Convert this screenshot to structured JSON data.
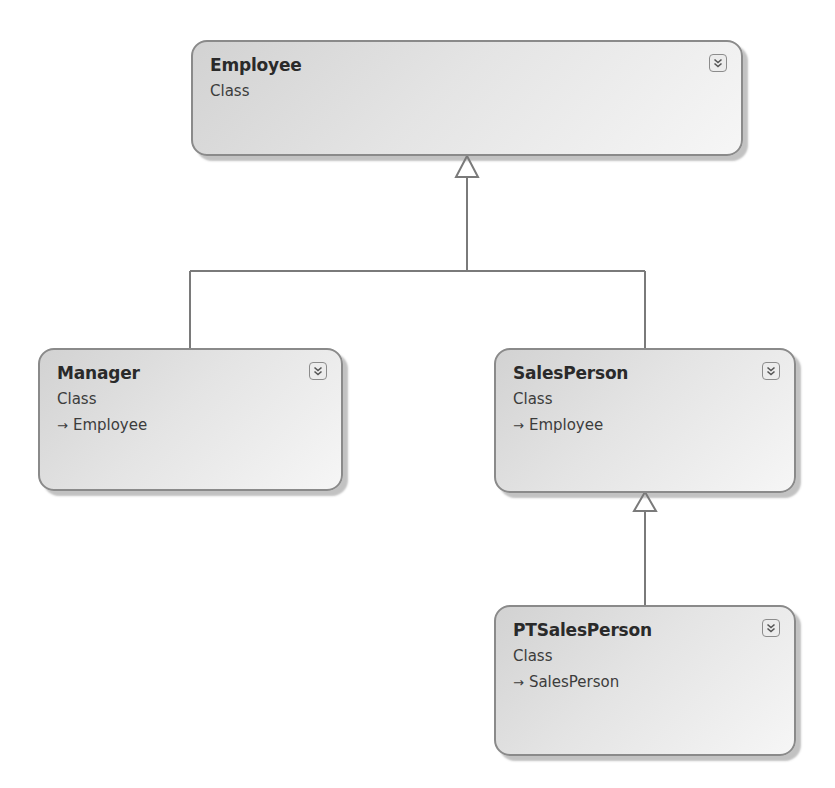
{
  "diagram": {
    "type": "class-diagram",
    "classes": [
      {
        "id": "employee",
        "name": "Employee",
        "kind": "Class",
        "base": null,
        "toggle_icon": "double-chevron-down-icon"
      },
      {
        "id": "manager",
        "name": "Manager",
        "kind": "Class",
        "base": "Employee",
        "toggle_icon": "double-chevron-down-icon"
      },
      {
        "id": "salesperson",
        "name": "SalesPerson",
        "kind": "Class",
        "base": "Employee",
        "toggle_icon": "double-chevron-down-icon"
      },
      {
        "id": "ptsalesperson",
        "name": "PTSalesPerson",
        "kind": "Class",
        "base": "SalesPerson",
        "toggle_icon": "double-chevron-down-icon"
      }
    ],
    "relationships": [
      {
        "type": "inheritance",
        "from": "Manager",
        "to": "Employee"
      },
      {
        "type": "inheritance",
        "from": "SalesPerson",
        "to": "Employee"
      },
      {
        "type": "inheritance",
        "from": "PTSalesPerson",
        "to": "SalesPerson"
      }
    ],
    "inherit_glyph": "→",
    "colors": {
      "box_border": "#8a8a8a",
      "box_fill_dark": "#d2d2d2",
      "box_fill_light": "#f6f6f6",
      "connector": "#7a7a7a",
      "text": "#2a2a2a"
    }
  }
}
